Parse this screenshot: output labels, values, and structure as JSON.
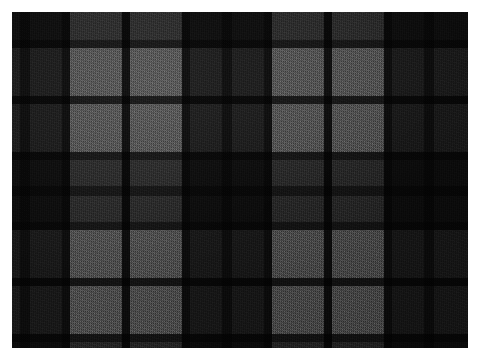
{
  "image": {
    "subject": "tartan-plaid-woven-fabric-swatch",
    "description": "Close-up photograph of a grayscale tartan / plaid woven wool fabric with a visible twill weave texture",
    "orientation": "landscape",
    "canvas": {
      "width": 479,
      "height": 360,
      "background": "#ffffff"
    },
    "swatch": {
      "x": 12,
      "y": 12,
      "width": 456,
      "height": 336
    }
  },
  "palette": {
    "background": "#ffffff",
    "black": "#191919",
    "dark_gray": "#343434",
    "mid_gray": "#6d6d6d",
    "light_gray": "#b0b0b0",
    "shadow": "#0d0d0d"
  },
  "weave": {
    "type": "twill",
    "direction": "diagonal",
    "thread_pitch_px": 2
  },
  "chart_data": {
    "type": "heatmap",
    "xlabel": "warp (horizontal position, px)",
    "ylabel": "weft (vertical position, px)",
    "grid": false,
    "legend": "none",
    "xlim": [
      0,
      456
    ],
    "ylim": [
      0,
      336
    ],
    "tones": {
      "K": "#191919",
      "D": "#343434",
      "M": "#6d6d6d",
      "L": "#b0b0b0"
    },
    "warp_bands": [
      {
        "start": 0,
        "width": 8,
        "tone": "D"
      },
      {
        "start": 8,
        "width": 10,
        "tone": "K"
      },
      {
        "start": 18,
        "width": 32,
        "tone": "D"
      },
      {
        "start": 50,
        "width": 8,
        "tone": "K"
      },
      {
        "start": 58,
        "width": 52,
        "tone": "L"
      },
      {
        "start": 110,
        "width": 8,
        "tone": "K"
      },
      {
        "start": 118,
        "width": 52,
        "tone": "L"
      },
      {
        "start": 170,
        "width": 8,
        "tone": "K"
      },
      {
        "start": 178,
        "width": 32,
        "tone": "D"
      },
      {
        "start": 210,
        "width": 10,
        "tone": "K"
      },
      {
        "start": 220,
        "width": 32,
        "tone": "D"
      },
      {
        "start": 252,
        "width": 8,
        "tone": "K"
      },
      {
        "start": 260,
        "width": 52,
        "tone": "L"
      },
      {
        "start": 312,
        "width": 8,
        "tone": "K"
      },
      {
        "start": 320,
        "width": 52,
        "tone": "L"
      },
      {
        "start": 372,
        "width": 8,
        "tone": "K"
      },
      {
        "start": 380,
        "width": 32,
        "tone": "D"
      },
      {
        "start": 412,
        "width": 10,
        "tone": "K"
      },
      {
        "start": 422,
        "width": 34,
        "tone": "D"
      }
    ],
    "weft_bands": [
      {
        "start": 0,
        "height": 28,
        "tone": "D"
      },
      {
        "start": 28,
        "height": 8,
        "tone": "K"
      },
      {
        "start": 36,
        "height": 48,
        "tone": "M"
      },
      {
        "start": 84,
        "height": 8,
        "tone": "K"
      },
      {
        "start": 92,
        "height": 48,
        "tone": "M"
      },
      {
        "start": 140,
        "height": 8,
        "tone": "K"
      },
      {
        "start": 148,
        "height": 26,
        "tone": "D"
      },
      {
        "start": 174,
        "height": 10,
        "tone": "K"
      },
      {
        "start": 184,
        "height": 26,
        "tone": "D"
      },
      {
        "start": 210,
        "height": 8,
        "tone": "K"
      },
      {
        "start": 218,
        "height": 48,
        "tone": "M"
      },
      {
        "start": 266,
        "height": 8,
        "tone": "K"
      },
      {
        "start": 274,
        "height": 48,
        "tone": "M"
      },
      {
        "start": 322,
        "height": 8,
        "tone": "K"
      },
      {
        "start": 330,
        "height": 6,
        "tone": "D"
      }
    ]
  }
}
